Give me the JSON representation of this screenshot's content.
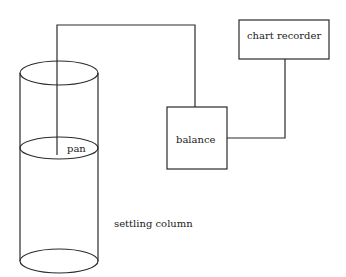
{
  "diagram": {
    "line_color": "#2a2a2a",
    "nodes": {
      "chart_recorder": {
        "label": "chart recorder"
      },
      "balance": {
        "label": "balance"
      },
      "pan": {
        "label": "pan"
      },
      "settling_column": {
        "label": "settling column"
      }
    },
    "connections": [
      {
        "from": "pan",
        "to": "balance"
      },
      {
        "from": "balance",
        "to": "chart_recorder"
      }
    ]
  }
}
